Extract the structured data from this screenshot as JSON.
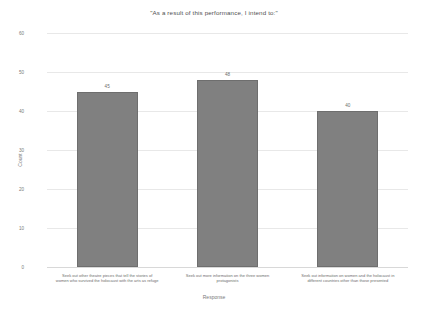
{
  "chart_data": {
    "type": "bar",
    "title": "\"As a result of this performance, I intend to:\"",
    "xlabel": "Response",
    "ylabel": "Count",
    "categories": [
      "Seek out other theatre pieces that tell the stories of women who survived the holocaust with the arts as refuge",
      "Seek out more information on the three women protagonists",
      "Seek out information on women and the holocaust in different countries other than those presented"
    ],
    "values": [
      45,
      48,
      40
    ],
    "value_labels": [
      "45",
      "48",
      "40"
    ],
    "ylim": [
      0,
      60
    ],
    "yticks": [
      0,
      10,
      20,
      30,
      40,
      50,
      60
    ],
    "ytick_labels": [
      "0",
      "10",
      "20",
      "30",
      "40",
      "50",
      "60"
    ],
    "grid": true,
    "legend": false,
    "bar_color": "#808080",
    "grid_color": "#e8e8e8",
    "text_color": "#6d6d6d"
  }
}
